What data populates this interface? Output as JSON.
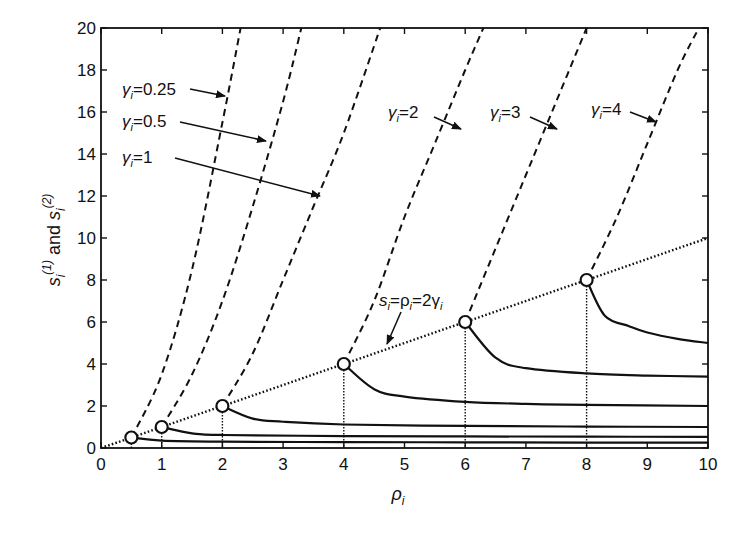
{
  "chart_data": {
    "type": "line",
    "title": "",
    "xlabel": "ρ_i",
    "ylabel": "s_i^(1) and s_i^(2)",
    "xlim": [
      0,
      10
    ],
    "ylim": [
      0,
      20
    ],
    "x_ticks": [
      0,
      1,
      2,
      3,
      4,
      5,
      6,
      7,
      8,
      9,
      10
    ],
    "y_ticks": [
      0,
      2,
      4,
      6,
      8,
      10,
      12,
      14,
      16,
      18,
      20
    ],
    "grid": false,
    "legend": null,
    "diagonal_line": {
      "label": "s_i=ρ_i=2γ_i",
      "style": "dotted",
      "x": [
        0,
        10
      ],
      "y": [
        0,
        10
      ]
    },
    "branch_points": [
      {
        "gamma": 0.25,
        "x": 0.5,
        "y": 0.5
      },
      {
        "gamma": 0.5,
        "x": 1,
        "y": 1
      },
      {
        "gamma": 1,
        "x": 2,
        "y": 2
      },
      {
        "gamma": 2,
        "x": 4,
        "y": 4
      },
      {
        "gamma": 3,
        "x": 6,
        "y": 6
      },
      {
        "gamma": 4,
        "x": 8,
        "y": 8
      }
    ],
    "series": [
      {
        "name": "γ_i=0.25 (s^(1), dashed)",
        "style": "dashed",
        "x": [
          0.5,
          1.0,
          1.5,
          2.0,
          2.3
        ],
        "y": [
          0.5,
          3.5,
          8.5,
          15.5,
          20
        ]
      },
      {
        "name": "γ_i=0.5 (s^(1), dashed)",
        "style": "dashed",
        "x": [
          1.0,
          1.5,
          2.0,
          2.5,
          3.0,
          3.3
        ],
        "y": [
          1.0,
          3.5,
          7.0,
          11.5,
          16.5,
          20
        ]
      },
      {
        "name": "γ_i=1 (s^(1), dashed)",
        "style": "dashed",
        "x": [
          2.0,
          2.5,
          3.0,
          3.5,
          4.0,
          4.6
        ],
        "y": [
          2.0,
          4.5,
          8.0,
          11.5,
          15.0,
          20
        ]
      },
      {
        "name": "γ_i=2 (s^(1), dashed)",
        "style": "dashed",
        "x": [
          4.0,
          4.5,
          5.0,
          5.5,
          6.0,
          6.3
        ],
        "y": [
          4.0,
          7.0,
          11.0,
          14.5,
          18.0,
          20
        ]
      },
      {
        "name": "γ_i=3 (s^(1), dashed)",
        "style": "dashed",
        "x": [
          6.0,
          6.5,
          7.0,
          7.5,
          8.0
        ],
        "y": [
          6.0,
          9.5,
          13.0,
          16.5,
          20
        ]
      },
      {
        "name": "γ_i=4 (s^(1), dashed)",
        "style": "dashed",
        "x": [
          8.0,
          8.5,
          9.0,
          9.5,
          9.85
        ],
        "y": [
          8.0,
          11.0,
          14.5,
          18.0,
          20
        ]
      },
      {
        "name": "γ_i=0.25 (s^(2), solid)",
        "style": "solid",
        "x": [
          0.5,
          1.0,
          2.0,
          4.0,
          6.0,
          8.0,
          10.0
        ],
        "y": [
          0.5,
          0.35,
          0.3,
          0.28,
          0.27,
          0.26,
          0.26
        ]
      },
      {
        "name": "γ_i=0.5 (s^(2), solid)",
        "style": "solid",
        "x": [
          1.0,
          1.5,
          2.0,
          4.0,
          6.0,
          8.0,
          10.0
        ],
        "y": [
          1.0,
          0.7,
          0.62,
          0.57,
          0.55,
          0.54,
          0.53
        ]
      },
      {
        "name": "γ_i=1 (s^(2), solid)",
        "style": "solid",
        "x": [
          2.0,
          2.5,
          3.0,
          4.0,
          6.0,
          8.0,
          10.0
        ],
        "y": [
          2.0,
          1.4,
          1.25,
          1.12,
          1.05,
          1.02,
          1.0
        ]
      },
      {
        "name": "γ_i=2 (s^(2), solid)",
        "style": "solid",
        "x": [
          4.0,
          4.5,
          5.0,
          6.0,
          7.0,
          8.0,
          10.0
        ],
        "y": [
          4.0,
          2.8,
          2.45,
          2.2,
          2.1,
          2.05,
          2.0
        ]
      },
      {
        "name": "γ_i=3 (s^(2), solid)",
        "style": "solid",
        "x": [
          6.0,
          6.5,
          7.0,
          8.0,
          9.0,
          10.0
        ],
        "y": [
          6.0,
          4.3,
          3.8,
          3.55,
          3.45,
          3.4
        ]
      },
      {
        "name": "γ_i=4 (s^(2), solid)",
        "style": "solid",
        "x": [
          8.0,
          8.3,
          8.7,
          9.0,
          9.5,
          10.0
        ],
        "y": [
          8.0,
          6.3,
          5.8,
          5.5,
          5.2,
          5.0
        ]
      }
    ],
    "annotations": [
      {
        "text": "γ_i=0.25",
        "arrow_to": [
          2.1,
          16.8
        ]
      },
      {
        "text": "γ_i=0.5",
        "arrow_to": [
          2.7,
          14.7
        ]
      },
      {
        "text": "γ_i=1",
        "arrow_to": [
          3.6,
          12.2
        ]
      },
      {
        "text": "γ_i=2",
        "arrow_to": [
          5.1,
          15.5
        ]
      },
      {
        "text": "γ_i=3",
        "arrow_to": [
          6.8,
          15.5
        ]
      },
      {
        "text": "γ_i=4",
        "arrow_to": [
          8.5,
          15.6
        ]
      },
      {
        "text": "s_i=ρ_i=2γ_i",
        "arrow_to": [
          3.0,
          3.0
        ]
      }
    ]
  },
  "labels": {
    "ylabel_main": "s",
    "ylabel_sub1": "i",
    "ylabel_sup1": "(1)",
    "ylabel_and": " and ",
    "ylabel_sub2": "i",
    "ylabel_sup2": "(2)",
    "xlabel_main": "ρ",
    "xlabel_sub": "i",
    "anno_g025": "γ",
    "anno_g025_sub": "i",
    "anno_g025_val": "=0.25",
    "anno_g05_val": "=0.5",
    "anno_g1_val": "=1",
    "anno_g2_val": "=2",
    "anno_g3_val": "=3",
    "anno_g4_val": "=4",
    "anno_diag_s": "s",
    "anno_diag_i1": "i",
    "anno_diag_eq1": "=ρ",
    "anno_diag_i2": "i",
    "anno_diag_eq2": "=2γ",
    "anno_diag_i3": "i"
  }
}
